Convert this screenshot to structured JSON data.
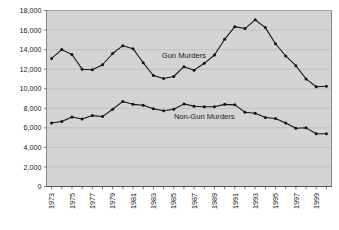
{
  "chart_data": {
    "type": "line",
    "title": "",
    "subtitle": "",
    "xlabel": "",
    "ylabel": "",
    "ylim": [
      0,
      18000
    ],
    "ytick_values": [
      0,
      2000,
      4000,
      6000,
      8000,
      10000,
      12000,
      14000,
      16000,
      18000
    ],
    "ytick_labels": [
      "0",
      "2,000",
      "4,000",
      "6,000",
      "8,000",
      "10,000",
      "12,000",
      "14,000",
      "16,000",
      "18,000"
    ],
    "grid": true,
    "grid_axis": "y",
    "legend": "inline-annotations",
    "x": [
      1973,
      1974,
      1975,
      1976,
      1977,
      1978,
      1979,
      1980,
      1981,
      1982,
      1983,
      1984,
      1985,
      1986,
      1987,
      1988,
      1989,
      1990,
      1991,
      1992,
      1993,
      1994,
      1995,
      1996,
      1997,
      1998,
      1999,
      2000
    ],
    "xtick_labels": [
      "1973",
      "",
      "1975",
      "",
      "1977",
      "",
      "1979",
      "",
      "1981",
      "",
      "1983",
      "",
      "1985",
      "",
      "1987",
      "",
      "1989",
      "",
      "1991",
      "",
      "1993",
      "",
      "1995",
      "",
      "1997",
      "",
      "1999",
      ""
    ],
    "xtick_labels_shown": [
      "1973",
      "1975",
      "1977",
      "1979",
      "1981",
      "1983",
      "1985",
      "1987",
      "1989",
      "1991",
      "1993",
      "1995",
      "1997",
      "1999"
    ],
    "series": [
      {
        "name": "Gun Murders",
        "color": "#111111",
        "marker": "circle",
        "label_x": 1986,
        "label_y": 13100,
        "values": [
          13100,
          14000,
          13500,
          12000,
          11950,
          12450,
          13600,
          14400,
          14100,
          12650,
          11350,
          11050,
          11250,
          12250,
          11900,
          12600,
          13450,
          15050,
          16350,
          16150,
          17050,
          16250,
          14600,
          13350,
          12350,
          11000,
          10200,
          10250
        ]
      },
      {
        "name": "Non-Gun Murders",
        "color": "#111111",
        "marker": "circle",
        "label_x": 1988,
        "label_y": 6950,
        "values": [
          6500,
          6650,
          7100,
          6900,
          7250,
          7150,
          7900,
          8700,
          8400,
          8300,
          7950,
          7750,
          7900,
          8450,
          8200,
          8150,
          8150,
          8400,
          8350,
          7600,
          7500,
          7050,
          6950,
          6500,
          5950,
          6000,
          5400,
          5400
        ]
      }
    ]
  }
}
